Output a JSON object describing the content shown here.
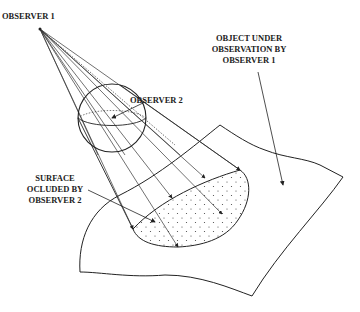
{
  "labels": {
    "observer1": "OBSERVER 1",
    "observer2": "OBSERVER 2",
    "object": [
      "OBJECT UNDER",
      "OBSERVATION BY",
      "OBSERVER 1"
    ],
    "occluded": [
      "SURFACE",
      "OCLUDED BY",
      "OBSERVER 2"
    ]
  },
  "colors": {
    "stroke": "#222222",
    "background": "#ffffff"
  }
}
